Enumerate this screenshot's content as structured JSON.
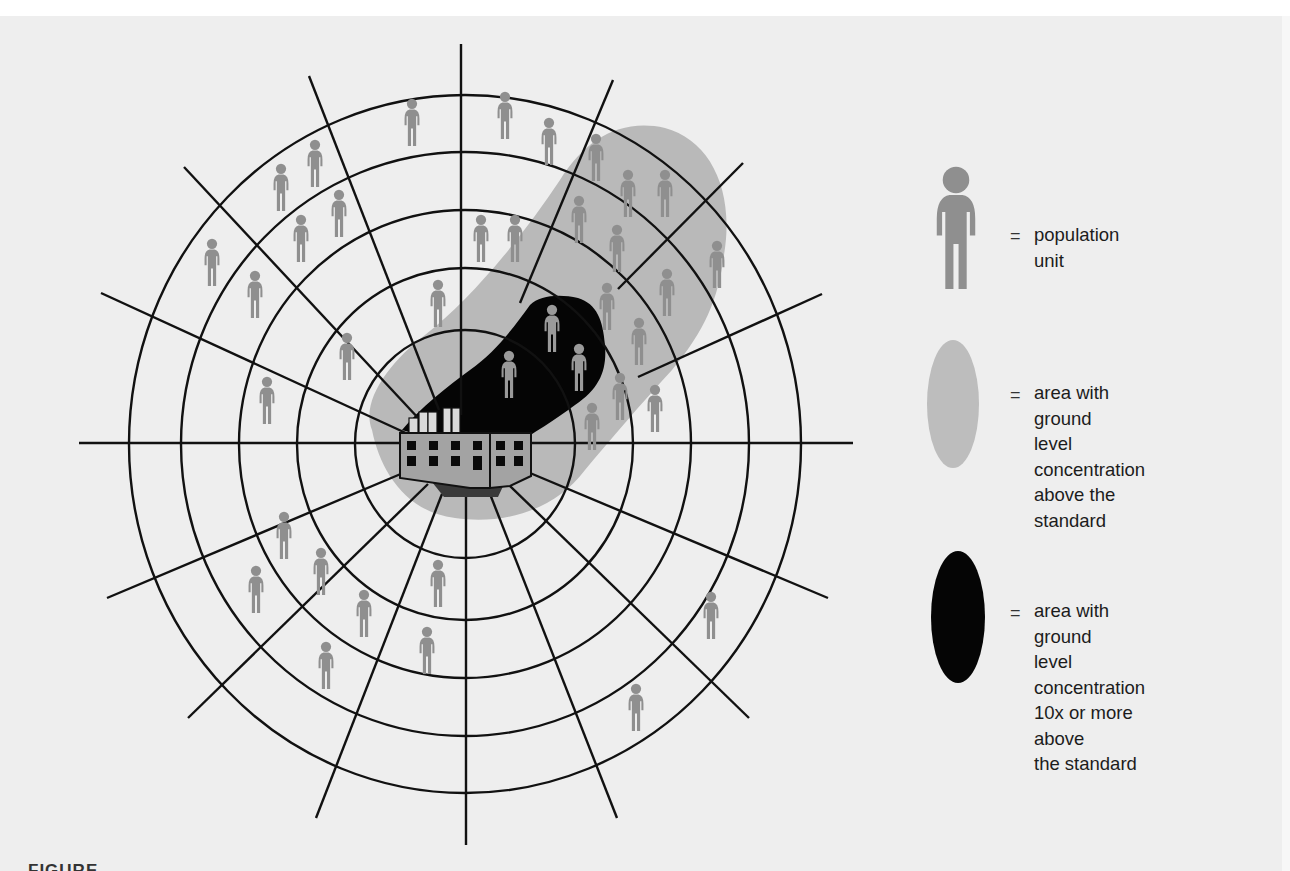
{
  "diagram": {
    "type": "radial-grid-exposure-map",
    "center": {
      "x": 465,
      "y": 444
    },
    "rings": {
      "rx": [
        110,
        168,
        226,
        284,
        336
      ],
      "ry": [
        114,
        176,
        234,
        292,
        349
      ]
    },
    "colors": {
      "paper": "#eeeeee",
      "grid_line": "#111111",
      "population_unit": "#8f8f8f",
      "plume_above_standard": "#b9b9b9",
      "plume_10x_standard": "#050505",
      "factory_body": "#a3a3a3",
      "factory_chimney": "#d9d9d9",
      "factory_base": "#3a3a3a"
    },
    "population_units": [
      {
        "x": 412,
        "y": 98
      },
      {
        "x": 505,
        "y": 91
      },
      {
        "x": 549,
        "y": 117
      },
      {
        "x": 315,
        "y": 139
      },
      {
        "x": 596,
        "y": 133
      },
      {
        "x": 281,
        "y": 163
      },
      {
        "x": 339,
        "y": 189
      },
      {
        "x": 628,
        "y": 169
      },
      {
        "x": 665,
        "y": 169
      },
      {
        "x": 579,
        "y": 195
      },
      {
        "x": 301,
        "y": 214
      },
      {
        "x": 481,
        "y": 214
      },
      {
        "x": 515,
        "y": 214
      },
      {
        "x": 617,
        "y": 224
      },
      {
        "x": 212,
        "y": 238
      },
      {
        "x": 717,
        "y": 240
      },
      {
        "x": 255,
        "y": 270
      },
      {
        "x": 667,
        "y": 268
      },
      {
        "x": 438,
        "y": 279
      },
      {
        "x": 607,
        "y": 282
      },
      {
        "x": 347,
        "y": 332
      },
      {
        "x": 639,
        "y": 317
      },
      {
        "x": 267,
        "y": 376
      },
      {
        "x": 620,
        "y": 372
      },
      {
        "x": 655,
        "y": 384
      },
      {
        "x": 592,
        "y": 402
      },
      {
        "x": 284,
        "y": 511
      },
      {
        "x": 321,
        "y": 547
      },
      {
        "x": 438,
        "y": 559
      },
      {
        "x": 256,
        "y": 565
      },
      {
        "x": 364,
        "y": 589
      },
      {
        "x": 711,
        "y": 591
      },
      {
        "x": 427,
        "y": 626
      },
      {
        "x": 326,
        "y": 641
      },
      {
        "x": 636,
        "y": 683
      }
    ],
    "population_units_in_10x_zone": [
      {
        "x": 552,
        "y": 304
      },
      {
        "x": 579,
        "y": 343
      },
      {
        "x": 509,
        "y": 350
      }
    ]
  },
  "legend": {
    "items": [
      {
        "symbol": "population-unit",
        "equals": "=",
        "lines": [
          "population unit"
        ]
      },
      {
        "symbol": "light-gray-ellipse",
        "equals": "=",
        "lines": [
          "area with ground",
          "level concentration",
          "above the",
          "standard"
        ]
      },
      {
        "symbol": "black-ellipse",
        "equals": "=",
        "lines": [
          "area with ground",
          "level concentration",
          "10x or more above",
          "the standard"
        ]
      }
    ]
  },
  "caption": {
    "visible_fragment": "FIGURE"
  }
}
